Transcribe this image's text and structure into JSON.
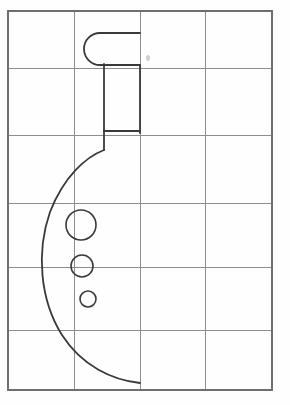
{
  "canvas": {
    "width": 290,
    "height": 405,
    "background": "#fefefe",
    "title": "Grid paper technical sketch of a bottle half-profile with three holes"
  },
  "colors": {
    "paper": "#fefefe",
    "grid_line": "#8d8d8d",
    "grid_border": "#6f6f6f",
    "drawing_stroke": "#3a3a3a",
    "smudge": "#cfcfcf"
  },
  "grid": {
    "label": "grid-paper",
    "columns": 4,
    "rows": 6,
    "x_lines": [
      8,
      74,
      140,
      205,
      272
    ],
    "y_lines": [
      11,
      68,
      135,
      203,
      267,
      330,
      390
    ],
    "line_width": 1,
    "border_width": 1.6
  },
  "drawing": {
    "name": "bottle-half-profile",
    "stroke_width": 1.8,
    "parts": [
      {
        "name": "cap-rounded-top",
        "description": "rounded capsule end at the top of the neck, open toward the right",
        "path": "M 140 33 L 100 33 A 16 16 0 0 0 100 65 L 140 65"
      },
      {
        "name": "neck-left-wall",
        "description": "vertical left wall of the neck running down from the cap",
        "path": "M 104 64 L 104 150"
      },
      {
        "name": "neck-right-wall",
        "description": "vertical right wall of the neck running down from the cap",
        "path": "M 140 65 L 140 133"
      },
      {
        "name": "shoulder-ledge",
        "description": "short horizontal ledge where the neck meets the shoulder",
        "path": "M 104 131 L 140 131"
      },
      {
        "name": "body-outline",
        "description": "large sweeping body contour from the shoulder down around to the bottom edge",
        "path": "M 104 150 C 86 157 64 176 50 212 C 36 252 40 300 62 335 C 82 366 112 380 140 383"
      }
    ],
    "holes": [
      {
        "name": "hole-large",
        "cx": 81,
        "cy": 225,
        "r": 15
      },
      {
        "name": "hole-medium",
        "cx": 82,
        "cy": 266,
        "r": 11
      },
      {
        "name": "hole-small",
        "cx": 88,
        "cy": 299,
        "r": 8
      }
    ],
    "marks": [
      {
        "name": "pencil-smudge",
        "cx": 148,
        "cy": 58,
        "rx": 2,
        "ry": 3
      }
    ]
  }
}
